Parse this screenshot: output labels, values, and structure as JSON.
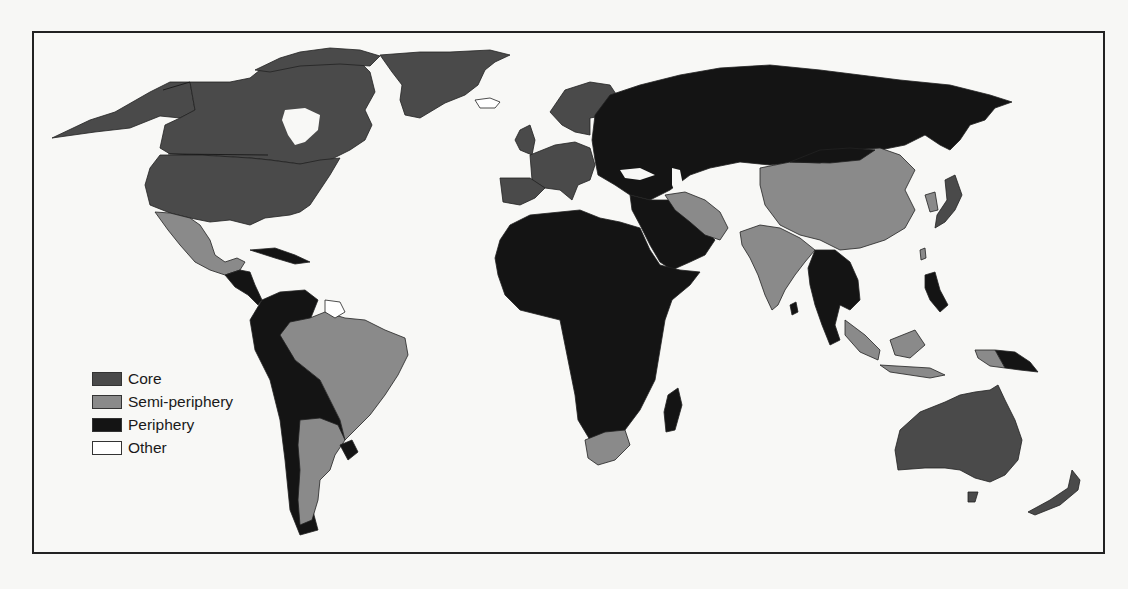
{
  "map": {
    "type": "choropleth-world-map",
    "title": "",
    "legend": {
      "position": "lower-left",
      "items": [
        {
          "label": "Core",
          "color": "#4a4a4a"
        },
        {
          "label": "Semi-periphery",
          "color": "#8a8a8a"
        },
        {
          "label": "Periphery",
          "color": "#141414"
        },
        {
          "label": "Other",
          "color": "#ffffff"
        }
      ]
    },
    "regions": {
      "core": [
        "Canada",
        "United States",
        "Greenland",
        "Western Europe",
        "Scandinavia",
        "United Kingdom",
        "Japan",
        "Australia",
        "New Zealand"
      ],
      "semi_periphery": [
        "Mexico",
        "Brazil",
        "Argentina",
        "Chile (partial)",
        "South Africa",
        "Iran",
        "India",
        "China",
        "Indonesia",
        "Malaysia",
        "South Korea",
        "Taiwan"
      ],
      "periphery": [
        "Russia / former USSR",
        "Eastern Europe",
        "Africa",
        "Middle East",
        "Central America",
        "Caribbean",
        "Andean South America",
        "Southeast Asia (mainland)",
        "Philippines",
        "Papua New Guinea",
        "Madagascar",
        "Sri Lanka",
        "Mongolia"
      ],
      "other": [
        "Iceland",
        "Guyana / Suriname / French Guiana",
        "Western Sahara",
        "Bhutan"
      ]
    }
  }
}
